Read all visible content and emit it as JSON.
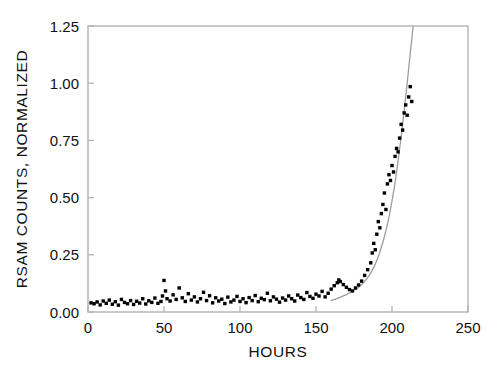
{
  "chart_data": {
    "type": "scatter",
    "title": "",
    "subtitle": "",
    "xlabel": "HOURS",
    "ylabel": "RSAM COUNTS, NORMALIZED",
    "xlim": [
      0,
      250
    ],
    "ylim": [
      0.0,
      1.25
    ],
    "xticks": [
      0,
      50,
      100,
      150,
      200,
      250
    ],
    "xtick_labels": [
      "0",
      "50",
      "100",
      "150",
      "200",
      "250"
    ],
    "yticks": [
      0.0,
      0.25,
      0.5,
      0.75,
      1.0,
      1.25
    ],
    "ytick_labels": [
      "0.00",
      "0.25",
      "0.50",
      "0.75",
      "1.00",
      "1.25"
    ],
    "grid": false,
    "legend": null,
    "legend_position": "none",
    "marker": "filled-square",
    "marker_color": "#000000",
    "fit_curve_color": "#9a9a9a",
    "frame_color": "#b3b3b3",
    "background_color": "#ffffff",
    "series": [
      {
        "name": "RSAM counts, normalized",
        "marker": "square",
        "color": "#000000",
        "points": [
          [
            2,
            0.04
          ],
          [
            4,
            0.036
          ],
          [
            6,
            0.044
          ],
          [
            8,
            0.031
          ],
          [
            10,
            0.048
          ],
          [
            12,
            0.038
          ],
          [
            14,
            0.052
          ],
          [
            16,
            0.034
          ],
          [
            18,
            0.045
          ],
          [
            20,
            0.03
          ],
          [
            22,
            0.055
          ],
          [
            24,
            0.042
          ],
          [
            26,
            0.036
          ],
          [
            28,
            0.05
          ],
          [
            30,
            0.033
          ],
          [
            32,
            0.047
          ],
          [
            34,
            0.039
          ],
          [
            36,
            0.058
          ],
          [
            38,
            0.035
          ],
          [
            40,
            0.049
          ],
          [
            42,
            0.042
          ],
          [
            44,
            0.061
          ],
          [
            46,
            0.038
          ],
          [
            48,
            0.046
          ],
          [
            49,
            0.07
          ],
          [
            50,
            0.138
          ],
          [
            51,
            0.092
          ],
          [
            52,
            0.058
          ],
          [
            54,
            0.048
          ],
          [
            56,
            0.075
          ],
          [
            58,
            0.055
          ],
          [
            60,
            0.105
          ],
          [
            62,
            0.062
          ],
          [
            64,
            0.046
          ],
          [
            66,
            0.08
          ],
          [
            68,
            0.052
          ],
          [
            70,
            0.066
          ],
          [
            72,
            0.044
          ],
          [
            74,
            0.058
          ],
          [
            76,
            0.086
          ],
          [
            78,
            0.05
          ],
          [
            80,
            0.071
          ],
          [
            82,
            0.04
          ],
          [
            84,
            0.062
          ],
          [
            86,
            0.048
          ],
          [
            88,
            0.056
          ],
          [
            90,
            0.037
          ],
          [
            92,
            0.065
          ],
          [
            94,
            0.044
          ],
          [
            96,
            0.052
          ],
          [
            98,
            0.068
          ],
          [
            100,
            0.046
          ],
          [
            102,
            0.058
          ],
          [
            104,
            0.041
          ],
          [
            106,
            0.063
          ],
          [
            108,
            0.05
          ],
          [
            110,
            0.072
          ],
          [
            112,
            0.045
          ],
          [
            114,
            0.06
          ],
          [
            116,
            0.054
          ],
          [
            118,
            0.082
          ],
          [
            120,
            0.049
          ],
          [
            122,
            0.066
          ],
          [
            124,
            0.056
          ],
          [
            126,
            0.043
          ],
          [
            128,
            0.061
          ],
          [
            130,
            0.052
          ],
          [
            132,
            0.07
          ],
          [
            134,
            0.058
          ],
          [
            136,
            0.048
          ],
          [
            138,
            0.074
          ],
          [
            140,
            0.063
          ],
          [
            142,
            0.055
          ],
          [
            144,
            0.085
          ],
          [
            146,
            0.068
          ],
          [
            148,
            0.06
          ],
          [
            150,
            0.078
          ],
          [
            152,
            0.07
          ],
          [
            154,
            0.09
          ],
          [
            156,
            0.066
          ],
          [
            158,
            0.082
          ],
          [
            160,
            0.1
          ],
          [
            162,
            0.115
          ],
          [
            164,
            0.128
          ],
          [
            165,
            0.14
          ],
          [
            166,
            0.133
          ],
          [
            168,
            0.12
          ],
          [
            170,
            0.108
          ],
          [
            172,
            0.098
          ],
          [
            174,
            0.092
          ],
          [
            176,
            0.105
          ],
          [
            178,
            0.118
          ],
          [
            180,
            0.135
          ],
          [
            182,
            0.16
          ],
          [
            184,
            0.185
          ],
          [
            186,
            0.215
          ],
          [
            187,
            0.258
          ],
          [
            188,
            0.3
          ],
          [
            189,
            0.272
          ],
          [
            190,
            0.34
          ],
          [
            191,
            0.395
          ],
          [
            192,
            0.368
          ],
          [
            193,
            0.43
          ],
          [
            194,
            0.47
          ],
          [
            195,
            0.52
          ],
          [
            196,
            0.448
          ],
          [
            197,
            0.56
          ],
          [
            198,
            0.6
          ],
          [
            199,
            0.575
          ],
          [
            200,
            0.64
          ],
          [
            201,
            0.612
          ],
          [
            202,
            0.68
          ],
          [
            203,
            0.715
          ],
          [
            204,
            0.7
          ],
          [
            205,
            0.76
          ],
          [
            206,
            0.82
          ],
          [
            207,
            0.795
          ],
          [
            208,
            0.87
          ],
          [
            209,
            0.905
          ],
          [
            210,
            0.86
          ],
          [
            211,
            0.94
          ],
          [
            212,
            0.985
          ],
          [
            213,
            0.92
          ]
        ]
      }
    ],
    "fit_curve": {
      "name": "accelerating trend fit",
      "color": "#9a9a9a",
      "points": [
        [
          160,
          0.05
        ],
        [
          165,
          0.062
        ],
        [
          170,
          0.076
        ],
        [
          175,
          0.094
        ],
        [
          178,
          0.108
        ],
        [
          181,
          0.126
        ],
        [
          184,
          0.15
        ],
        [
          186,
          0.17
        ],
        [
          188,
          0.195
        ],
        [
          190,
          0.225
        ],
        [
          192,
          0.262
        ],
        [
          194,
          0.305
        ],
        [
          196,
          0.355
        ],
        [
          198,
          0.415
        ],
        [
          200,
          0.485
        ],
        [
          202,
          0.565
        ],
        [
          204,
          0.66
        ],
        [
          206,
          0.765
        ],
        [
          208,
          0.88
        ],
        [
          210,
          1.0
        ],
        [
          212,
          1.13
        ],
        [
          214,
          1.255
        ]
      ]
    }
  },
  "axes": {
    "x_title": "HOURS",
    "y_title": "RSAM COUNTS, NORMALIZED"
  }
}
